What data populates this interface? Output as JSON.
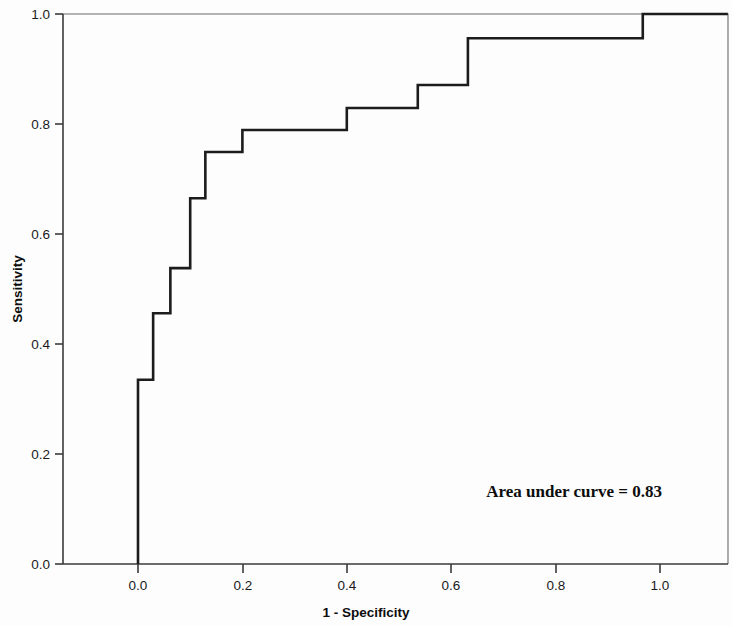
{
  "chart_data": {
    "type": "line",
    "title": "",
    "subtitle": "",
    "xlabel": "1 - Specificity",
    "ylabel": "Sensitivity",
    "xlim": [
      -0.07,
      1.13
    ],
    "ylim": [
      -0.03,
      1.0
    ],
    "grid": false,
    "legend": null,
    "xticks": [
      "0.0",
      "0.2",
      "0.4",
      "0.6",
      "0.8",
      "1.0"
    ],
    "xtick_values": [
      0.0,
      0.2,
      0.4,
      0.6,
      0.8,
      1.0
    ],
    "yticks": [
      "0.0",
      "0.2",
      "0.4",
      "0.6",
      "0.8",
      "1.0"
    ],
    "ytick_values": [
      0.0,
      0.2,
      0.4,
      0.6,
      0.8,
      1.0
    ],
    "annotations": [
      {
        "name": "auc-annotation",
        "text": "Area under curve = 0.83",
        "x": 0.66,
        "y": 0.145
      }
    ],
    "series": [
      {
        "name": "ROC curve",
        "style": "step",
        "color": "#1c1c1c",
        "x": [
          0.0,
          0.0,
          0.029,
          0.029,
          0.062,
          0.062,
          0.1,
          0.1,
          0.129,
          0.129,
          0.2,
          0.2,
          0.4,
          0.4,
          0.536,
          0.536,
          0.632,
          0.632,
          0.967,
          0.967,
          1.13
        ],
        "y": [
          0.0,
          0.335,
          0.335,
          0.456,
          0.456,
          0.538,
          0.538,
          0.665,
          0.665,
          0.749,
          0.749,
          0.789,
          0.789,
          0.829,
          0.829,
          0.871,
          0.871,
          0.956,
          0.956,
          1.0,
          1.0
        ]
      }
    ],
    "auc": 0.83
  },
  "axes": {
    "x_title": "1 - Specificity",
    "y_title": "Sensitivity"
  },
  "annotation": {
    "auc_text": "Area under curve = 0.83"
  },
  "xtick_labels": {
    "t0": "0.0",
    "t1": "0.2",
    "t2": "0.4",
    "t3": "0.6",
    "t4": "0.8",
    "t5": "1.0"
  },
  "ytick_labels": {
    "t0": "0.0",
    "t1": "0.2",
    "t2": "0.4",
    "t3": "0.6",
    "t4": "0.8",
    "t5": "1.0"
  },
  "colors": {
    "curve": "#1c1c1c",
    "axis": "#3a3a3a",
    "frame": "#6a6a6a",
    "background": "#fdfdfd"
  }
}
